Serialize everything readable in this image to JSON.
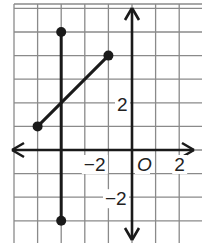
{
  "chart_data": {
    "type": "line",
    "title": "",
    "xlabel": "",
    "ylabel": "",
    "xlim": [
      -5,
      2
    ],
    "ylim": [
      -6,
      6
    ],
    "grid": true,
    "grid_unit": 1,
    "origin_label": "O",
    "x_tick_labels": [
      {
        "value": -2,
        "label": "−2"
      },
      {
        "value": 2,
        "label": "2"
      }
    ],
    "y_tick_labels": [
      {
        "value": 2,
        "label": "2"
      },
      {
        "value": -2,
        "label": "−2"
      }
    ],
    "series": [
      {
        "name": "vertical-segment",
        "points": [
          [
            -3,
            5
          ],
          [
            -3,
            -3
          ]
        ],
        "endpoints": "closed-dots"
      },
      {
        "name": "diagonal-segment",
        "points": [
          [
            -4,
            1
          ],
          [
            -1,
            4
          ]
        ],
        "endpoints": "closed-dots"
      }
    ],
    "colors": {
      "grid": "#8a8a8a",
      "axes": "#1a1a1a",
      "segments": "#1a1a1a",
      "background": "#ffffff"
    }
  }
}
